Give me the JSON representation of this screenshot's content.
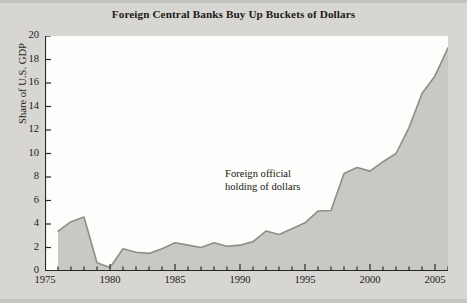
{
  "figure": {
    "title": "Foreign Central Banks Buy Up Buckets of Dollars",
    "background_color": "#d7d6d2",
    "plot_background_color": "#fdfdfb",
    "area_fill_color": "#c8c8c4",
    "line_color": "#8e8e88",
    "axis_color": "#2b2926"
  },
  "annotation": {
    "text": "Foreign official\nholding of dollars"
  },
  "axes": {
    "y_title": "Share of U.S. GDP",
    "y_ticks": [
      "0",
      "2",
      "4",
      "6",
      "8",
      "10",
      "12",
      "14",
      "16",
      "18",
      "20"
    ],
    "x_ticks": [
      "1975",
      "1980",
      "1985",
      "1990",
      "1995",
      "2000",
      "2005"
    ]
  },
  "chart_data": {
    "type": "area",
    "title": "Foreign Central Banks Buy Up Buckets of Dollars",
    "xlabel": "",
    "ylabel": "Share of U.S. GDP",
    "xlim": [
      1975,
      2006
    ],
    "ylim": [
      0,
      20
    ],
    "grid": false,
    "legend_position": "none",
    "annotations": [
      {
        "text": "Foreign official holding of dollars",
        "x": 1992,
        "y": 8.2
      }
    ],
    "series": [
      {
        "name": "Foreign official holding of dollars",
        "x": [
          1976,
          1977,
          1978,
          1979,
          1980,
          1981,
          1982,
          1983,
          1984,
          1985,
          1986,
          1987,
          1988,
          1989,
          1990,
          1991,
          1992,
          1993,
          1994,
          1995,
          1996,
          1997,
          1998,
          1999,
          2000,
          2001,
          2002,
          2003,
          2004,
          2005,
          2006
        ],
        "values": [
          3.4,
          4.2,
          4.6,
          0.7,
          0.3,
          1.9,
          1.6,
          1.5,
          1.9,
          2.4,
          2.2,
          2.0,
          2.4,
          2.1,
          2.2,
          2.5,
          3.4,
          3.1,
          3.6,
          4.1,
          5.1,
          5.15,
          8.3,
          8.8,
          8.5,
          9.3,
          10.0,
          12.2,
          15.1,
          16.6,
          19.0
        ]
      }
    ]
  }
}
